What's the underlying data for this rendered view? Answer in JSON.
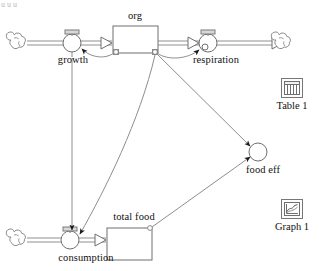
{
  "diagram": {
    "kind": "stock-and-flow-model",
    "title_fragment": "uuu",
    "stocks": [
      {
        "id": "org",
        "label": "org",
        "x": 113,
        "y": 26,
        "w": 45,
        "h": 27,
        "label_x": 135,
        "label_y": 12
      },
      {
        "id": "total_food",
        "label": "total food",
        "x": 107,
        "y": 228,
        "w": 45,
        "h": 32,
        "label_x": 134,
        "label_y": 213
      }
    ],
    "flows": [
      {
        "id": "growth",
        "label": "growth",
        "cx": 72,
        "cy": 43,
        "r": 9,
        "label_x": 72,
        "label_y": 54
      },
      {
        "id": "respiration",
        "label": "respiration",
        "cx": 208,
        "cy": 43,
        "r": 9,
        "label_x": 215,
        "label_y": 54
      },
      {
        "id": "consumption",
        "label": "consumption",
        "cx": 70,
        "cy": 240,
        "r": 9,
        "label_x": 85,
        "label_y": 251
      }
    ],
    "converters": [
      {
        "id": "food_eff",
        "label": "food eff",
        "cx": 258,
        "cy": 152,
        "r": 9,
        "label_x": 262,
        "label_y": 163
      }
    ],
    "clouds": [
      {
        "id": "source-growth",
        "cx": 18,
        "cy": 43
      },
      {
        "id": "sink-respiration",
        "cx": 283,
        "cy": 43
      },
      {
        "id": "source-consumption",
        "cx": 18,
        "cy": 240
      }
    ],
    "connectors": [
      {
        "id": "org-to-growth",
        "from": "org",
        "to": "growth"
      },
      {
        "id": "org-to-respiration",
        "from": "org",
        "to": "respiration"
      },
      {
        "id": "org-to-consumption",
        "from": "org",
        "to": "consumption"
      },
      {
        "id": "org-to-food-eff",
        "from": "org",
        "to": "food_eff"
      },
      {
        "id": "growth-to-consumption",
        "from": "growth",
        "to": "consumption"
      },
      {
        "id": "total-food-to-food-eff",
        "from": "total_food",
        "to": "food_eff"
      }
    ],
    "colors": {
      "outline": "#6b6b6b",
      "pipe": "#8a8a8a",
      "connector": "#8e8e8e",
      "text": "#111111",
      "arrow": "#1a1a1a"
    }
  },
  "tools": [
    {
      "id": "table-1",
      "label": "Table 1",
      "icon": "table-icon",
      "x": 272,
      "y": 78
    },
    {
      "id": "graph-1",
      "label": "Graph 1",
      "icon": "graph-icon",
      "x": 272,
      "y": 199
    }
  ]
}
